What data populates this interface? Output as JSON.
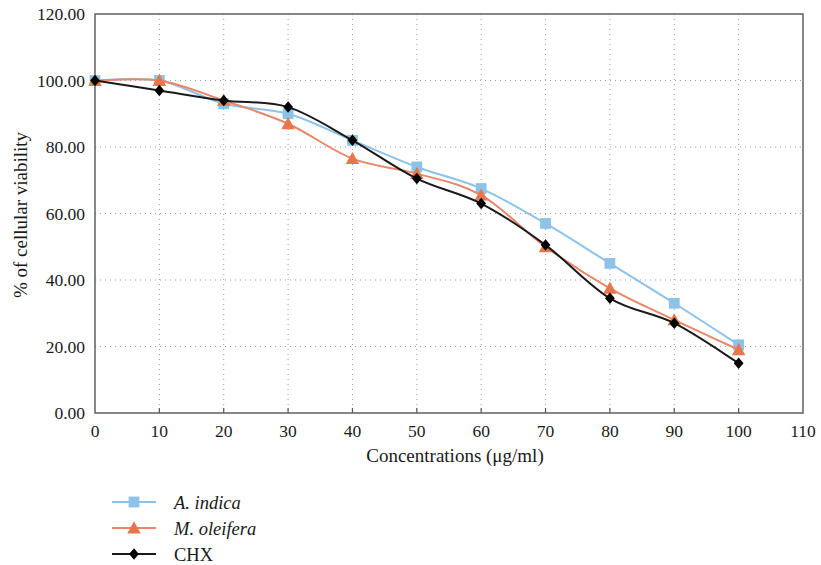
{
  "figure": {
    "background_color": "#ffffff",
    "frame_color": "#555555",
    "grid_color": "#9b9b9b"
  },
  "chart_data": {
    "type": "line",
    "title": "",
    "subtitle": "",
    "xlabel": "Concentrations (μg/ml)",
    "ylabel": "% of cellular viability",
    "x": [
      0,
      10,
      20,
      30,
      40,
      50,
      60,
      70,
      80,
      90,
      100
    ],
    "xlim": [
      0,
      110
    ],
    "ylim": [
      0,
      120
    ],
    "xticks": [
      0,
      10,
      20,
      30,
      40,
      50,
      60,
      70,
      80,
      90,
      100,
      110
    ],
    "xtick_labels": [
      "0",
      "10",
      "20",
      "30",
      "40",
      "50",
      "60",
      "70",
      "80",
      "90",
      "100",
      "110"
    ],
    "yticks": [
      0,
      20,
      40,
      60,
      80,
      100,
      120
    ],
    "ytick_labels": [
      "0.00",
      "20.00",
      "40.00",
      "60.00",
      "80.00",
      "100.00",
      "120.00"
    ],
    "grid": true,
    "grid_style": "dotted",
    "legend_position": "below-left",
    "series": [
      {
        "name": "A. indica",
        "italic": true,
        "color": "#8DC3E8",
        "marker": "square",
        "marker_color": "#8DC3E8",
        "values": [
          100.0,
          100.0,
          93.0,
          90.0,
          82.0,
          74.0,
          67.5,
          57.0,
          45.0,
          33.0,
          20.5
        ]
      },
      {
        "name": "M. oleifera",
        "italic": true,
        "color": "#E8876A",
        "marker": "triangle",
        "marker_color": "#E8764A",
        "values": [
          100.0,
          100.0,
          94.0,
          87.0,
          76.5,
          72.0,
          65.5,
          50.0,
          37.5,
          28.0,
          19.0
        ]
      },
      {
        "name": "CHX",
        "italic": false,
        "color": "#1a1a1a",
        "marker": "diamond",
        "marker_color": "#000000",
        "values": [
          100.0,
          97.0,
          94.0,
          92.0,
          82.0,
          70.5,
          63.0,
          50.5,
          34.5,
          27.0,
          15.0
        ]
      }
    ]
  }
}
